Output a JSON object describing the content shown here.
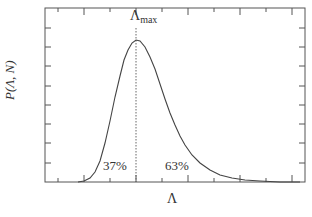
{
  "chart_data": {
    "type": "line",
    "title": "",
    "xlabel": "Λ",
    "ylabel": "P(Λ, N)",
    "grid": false,
    "legend": null,
    "x_ticks_labeled": false,
    "y_ticks_labeled": false,
    "frame": {
      "left": 45,
      "top": 8,
      "right": 305,
      "bottom": 182
    },
    "x_tick_positions": [
      58,
      84,
      110,
      136,
      162,
      188,
      214,
      240,
      266,
      292
    ],
    "y_tick_positions": [
      28,
      47,
      66,
      86,
      105,
      124,
      143,
      163
    ],
    "series": [
      {
        "name": "P(Λ, N)",
        "style": "solid",
        "color": "#444444",
        "points_px": [
          [
            78,
            182
          ],
          [
            84,
            181
          ],
          [
            90,
            178
          ],
          [
            95,
            172
          ],
          [
            100,
            161
          ],
          [
            105,
            143
          ],
          [
            110,
            121
          ],
          [
            115,
            97
          ],
          [
            120,
            76
          ],
          [
            124,
            60
          ],
          [
            128,
            50
          ],
          [
            132,
            43
          ],
          [
            136,
            40
          ],
          [
            140,
            41
          ],
          [
            145,
            47
          ],
          [
            150,
            57
          ],
          [
            155,
            69
          ],
          [
            160,
            84
          ],
          [
            165,
            99
          ],
          [
            170,
            113
          ],
          [
            175,
            125
          ],
          [
            180,
            136
          ],
          [
            185,
            145
          ],
          [
            192,
            155
          ],
          [
            200,
            163
          ],
          [
            210,
            170
          ],
          [
            220,
            175
          ],
          [
            232,
            178
          ],
          [
            245,
            180
          ],
          [
            260,
            181
          ],
          [
            280,
            182
          ],
          [
            300,
            182
          ]
        ]
      }
    ],
    "annotations": [
      {
        "text": "Λ",
        "sub": "max",
        "x": 136,
        "y": 22,
        "note": "peak marker with dotted vertical line"
      },
      {
        "text": "37%",
        "x": 118,
        "y": 165,
        "note": "area fraction left of peak"
      },
      {
        "text": "63%",
        "x": 180,
        "y": 165,
        "note": "area fraction right of peak"
      }
    ],
    "peak": {
      "x_px": 136,
      "y_px": 40
    },
    "area_split": {
      "left_percent": 37,
      "right_percent": 63
    }
  },
  "labels": {
    "y_axis": "P(Λ, N)",
    "x_axis": "Λ",
    "peak_symbol": "Λ",
    "peak_sub": "max",
    "left_pct": "37%",
    "right_pct": "63%"
  },
  "colors": {
    "axis": "#555555",
    "curve": "#444444",
    "dotted": "#666666",
    "background": "#ffffff"
  }
}
